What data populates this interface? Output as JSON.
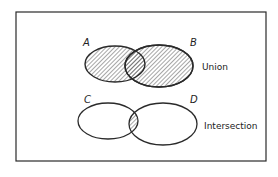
{
  "diagram": {
    "type": "venn",
    "panels": [
      {
        "caption": "Union",
        "sets": [
          {
            "label": "A",
            "shaded": true
          },
          {
            "label": "B",
            "shaded": true
          }
        ],
        "shaded_region": "A ∪ B"
      },
      {
        "caption": "Intersection",
        "sets": [
          {
            "label": "C",
            "shaded": false
          },
          {
            "label": "D",
            "shaded": false
          }
        ],
        "shaded_region": "C ∩ D"
      }
    ]
  },
  "colors": {
    "stroke": "#2a2a2a",
    "hatch": "#3a3a3a",
    "background": "#ffffff"
  }
}
